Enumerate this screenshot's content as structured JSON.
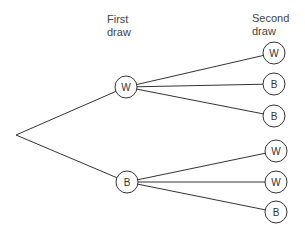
{
  "headers": {
    "first_line1": "First",
    "first_line2": "draw",
    "second_line1": "Second",
    "second_line2": "draw"
  },
  "tree": {
    "root": {
      "x": 16,
      "y": 135
    },
    "first_draw": [
      {
        "label": "W",
        "x": 126,
        "y": 87,
        "children": [
          {
            "label": "W",
            "x": 274,
            "y": 53
          },
          {
            "label": "B",
            "x": 274,
            "y": 84
          },
          {
            "label": "B",
            "x": 274,
            "y": 116
          }
        ]
      },
      {
        "label": "B",
        "x": 127,
        "y": 182,
        "children": [
          {
            "label": "W",
            "x": 276,
            "y": 151
          },
          {
            "label": "W",
            "x": 276,
            "y": 182
          },
          {
            "label": "B",
            "x": 276,
            "y": 212
          }
        ]
      }
    ],
    "node_radius": 11
  }
}
